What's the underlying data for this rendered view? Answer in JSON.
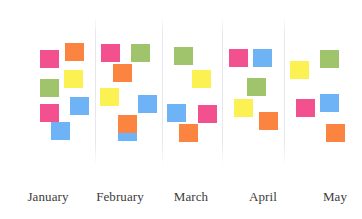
{
  "colors": {
    "pink": "#f2508f",
    "orange": "#fb8440",
    "yellow": "#fbf152",
    "green": "#9fc46b",
    "blue": "#6db3f5"
  },
  "columns": [
    {
      "label": "January",
      "notes": [
        "pink",
        "orange",
        "yellow",
        "green",
        "pink",
        "blue",
        "blue"
      ]
    },
    {
      "label": "February",
      "notes": [
        "pink",
        "green",
        "orange",
        "yellow",
        "blue",
        "blue",
        "orange"
      ]
    },
    {
      "label": "March",
      "notes": [
        "green",
        "yellow",
        "blue",
        "pink",
        "orange"
      ]
    },
    {
      "label": "April",
      "notes": [
        "pink",
        "blue",
        "green",
        "yellow",
        "orange"
      ]
    },
    {
      "label": "May",
      "notes": [
        "yellow",
        "green",
        "pink",
        "blue",
        "orange"
      ]
    }
  ]
}
